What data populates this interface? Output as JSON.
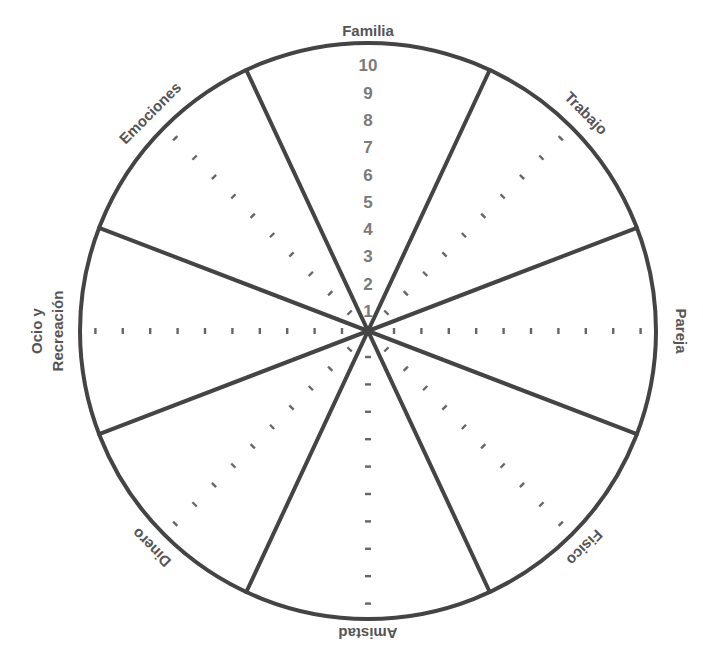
{
  "diagram": {
    "type": "wheel-of-life",
    "center": [
      368,
      331
    ],
    "radius": 288,
    "stroke_color": "#444444",
    "label_color": "#555555",
    "number_color": "#7a7a7a",
    "tick_color": "#666666",
    "spoke_angles_deg": [
      25,
      -25,
      69,
      -69
    ],
    "categories": [
      {
        "label": "Familia",
        "angle": 0,
        "lines": [
          "Familia"
        ]
      },
      {
        "label": "Trabajo",
        "angle": 45,
        "lines": [
          "Trabajo"
        ]
      },
      {
        "label": "Pareja",
        "angle": 90,
        "lines": [
          "Pareja"
        ]
      },
      {
        "label": "Fisico",
        "angle": 135,
        "lines": [
          "Fisico"
        ]
      },
      {
        "label": "Amistad",
        "angle": 180,
        "lines": [
          "Amistad"
        ]
      },
      {
        "label": "Dinero",
        "angle": 225,
        "lines": [
          "Dinero"
        ]
      },
      {
        "label": "Ocio y Recreación",
        "angle": 270,
        "lines": [
          "Ocio y",
          "Recreación"
        ]
      },
      {
        "label": "Emociones",
        "angle": 315,
        "lines": [
          "Emociones"
        ]
      }
    ],
    "scale": [
      "1",
      "2",
      "3",
      "4",
      "5",
      "6",
      "7",
      "8",
      "9",
      "10"
    ]
  }
}
